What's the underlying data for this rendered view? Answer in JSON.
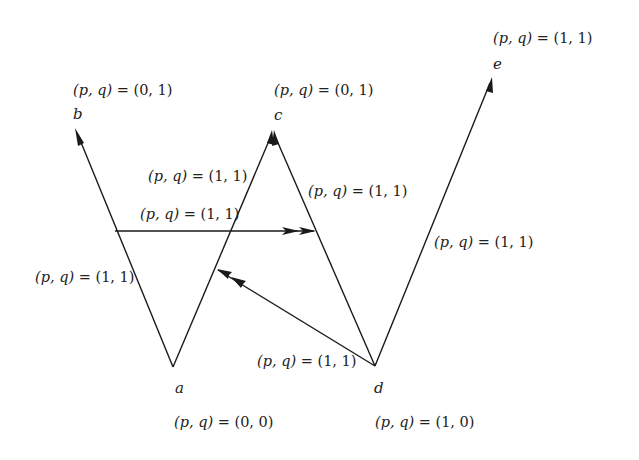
{
  "diagram": {
    "type": "directed game graph",
    "nodes": [
      {
        "id": "a",
        "label": "a",
        "pq": "(0, 0)",
        "x": 173,
        "y": 367
      },
      {
        "id": "b",
        "label": "b",
        "pq": "(0, 1)",
        "x": 75,
        "y": 128
      },
      {
        "id": "c",
        "label": "c",
        "pq": "(0, 1)",
        "x": 273,
        "y": 130
      },
      {
        "id": "d",
        "label": "d",
        "pq": "(1, 0)",
        "x": 375,
        "y": 366
      },
      {
        "id": "e",
        "label": "e",
        "pq": "(1, 1)",
        "x": 492,
        "y": 77
      }
    ],
    "edges": [
      {
        "from": "a",
        "to": "b",
        "pq": "(1, 1)"
      },
      {
        "from": "a",
        "to": "c",
        "pq": "(1, 1)"
      },
      {
        "from": "d",
        "to": "c",
        "pq": "(1, 1)"
      },
      {
        "from": "d",
        "to": "e",
        "pq": "(1, 1)"
      },
      {
        "from": "edge(a,b)",
        "to": "edge(d,c)",
        "pq": "(1, 1)"
      },
      {
        "from": "d",
        "to": "edge(a,c)",
        "pq": "(1, 1)"
      }
    ],
    "pq_prefix": "(p, q) = "
  },
  "labels": {
    "node_a": "a",
    "node_b": "b",
    "node_c": "c",
    "node_d": "d",
    "node_e": "e",
    "node_a_pq": "(0, 0)",
    "node_b_pq": "(0, 1)",
    "node_c_pq": "(0, 1)",
    "node_d_pq": "(1, 0)",
    "node_e_pq": "(1, 1)",
    "edge_ab_pq": "(1, 1)",
    "edge_ac_pq": "(1, 1)",
    "edge_dc_pq": "(1, 1)",
    "edge_de_pq": "(1, 1)",
    "edge_horizontal_pq": "(1, 1)",
    "edge_d_to_ac_pq": "(1, 1)"
  }
}
